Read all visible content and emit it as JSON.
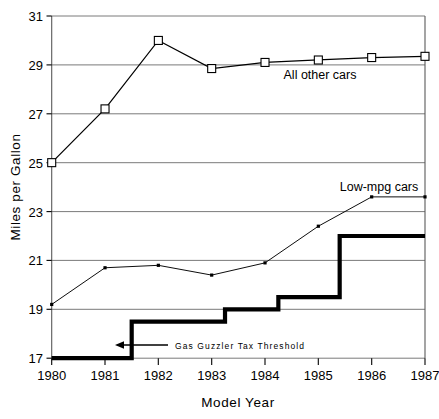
{
  "chart_data": {
    "type": "line",
    "title": "",
    "xlabel": "Model Year",
    "ylabel": "Miles per Gallon",
    "x": [
      1980,
      1981,
      1982,
      1983,
      1984,
      1985,
      1986,
      1987
    ],
    "xtick_labels": [
      "1980",
      "1981",
      "1982",
      "1983",
      "1984",
      "1985",
      "1986",
      "1987"
    ],
    "ytick_labels": [
      "31",
      "29",
      "27",
      "25",
      "23",
      "21",
      "19",
      "17"
    ],
    "yticks": [
      31,
      29,
      27,
      25,
      23,
      21,
      19,
      17
    ],
    "ylim": [
      17,
      31
    ],
    "xlim": [
      1980,
      1987
    ],
    "grid": "horizontal",
    "legend_position": "inline-annotation",
    "series": [
      {
        "name": "All other cars",
        "label": "All other cars",
        "marker": "open-square",
        "values": [
          25.0,
          27.2,
          30.0,
          28.85,
          29.1,
          29.2,
          29.3,
          29.35
        ]
      },
      {
        "name": "Low-mpg cars",
        "label": "Low-mpg cars",
        "marker": "filled-dot",
        "values": [
          19.2,
          20.7,
          20.8,
          20.4,
          20.9,
          22.4,
          23.6,
          23.6
        ]
      }
    ],
    "step_series": {
      "name": "Gas Guzzler Tax Threshold",
      "label": "Gas Guzzler Tax Threshold",
      "style": "thick-step",
      "steps": [
        {
          "x_start": 1980.0,
          "x_end": 1981.5,
          "value": 17.0
        },
        {
          "x_start": 1981.5,
          "x_end": 1983.25,
          "value": 18.5
        },
        {
          "x_start": 1983.25,
          "x_end": 1984.25,
          "value": 19.0
        },
        {
          "x_start": 1984.25,
          "x_end": 1985.4,
          "value": 19.5
        },
        {
          "x_start": 1985.4,
          "x_end": 1987.0,
          "value": 22.0
        }
      ]
    },
    "annotations": [
      {
        "text": "Gas Guzzler Tax Threshold",
        "arrow": "left",
        "value_y": 17.6,
        "value_x": 1982.1
      },
      {
        "text": "All other cars",
        "value_y": 28.4,
        "value_x": 1984.2
      },
      {
        "text": "Low-mpg cars",
        "value_y": 24.4,
        "value_x": 1985.0
      }
    ]
  }
}
